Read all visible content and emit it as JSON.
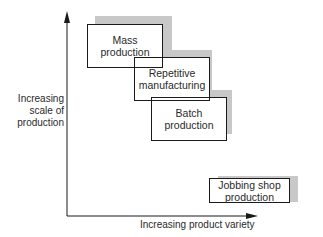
{
  "diagram": {
    "y_axis_label": "Increasing scale of production",
    "y_axis_lines": [
      "Increasing",
      "scale of",
      "production"
    ],
    "x_axis_label": "Increasing product variety",
    "boxes": [
      {
        "id": "mass",
        "lines": [
          "Mass",
          "production"
        ]
      },
      {
        "id": "repetitive",
        "lines": [
          "Repetitive",
          "manufacturing"
        ]
      },
      {
        "id": "batch",
        "lines": [
          "Batch",
          "production"
        ]
      },
      {
        "id": "jobbing",
        "lines": [
          "Jobbing shop",
          "production"
        ]
      }
    ],
    "colors": {
      "line": "#1a1a1a",
      "shadow": "#c8c8c8",
      "background": "#ffffff"
    }
  }
}
